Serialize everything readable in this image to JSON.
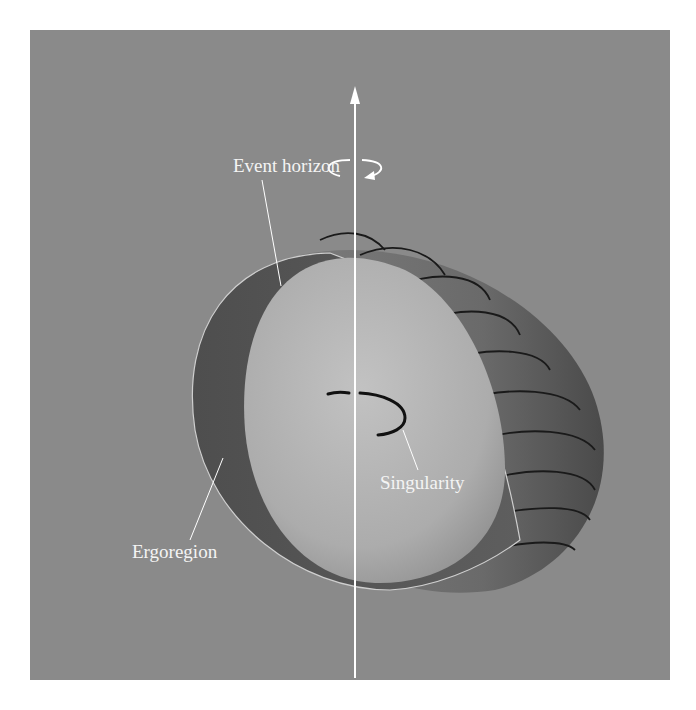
{
  "figure": {
    "colors": {
      "background": "#8a8a8a",
      "ergoregion_inner": "#585858",
      "ergoregion_outer": "#6e6e6e",
      "event_horizon": "#b4b4b4",
      "axis": "#ffffff",
      "bands": "#1a1a1a"
    }
  },
  "labels": {
    "event_horizon": "Event horizon",
    "singularity": "Singularity",
    "ergoregion": "Ergoregion"
  },
  "icons": {
    "rotation": "rotation-arrow-icon",
    "axis_arrow": "arrow-up-icon"
  }
}
